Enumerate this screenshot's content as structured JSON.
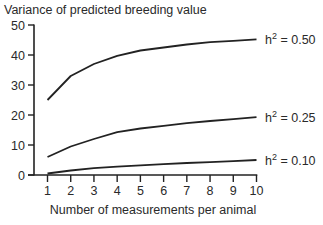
{
  "chart_data": {
    "type": "line",
    "title": "Variance of predicted breeding value",
    "xlabel": "Number of measurements per animal",
    "ylabel": "Variance of predicted breeding value",
    "x": [
      1,
      2,
      3,
      4,
      5,
      6,
      7,
      8,
      9,
      10
    ],
    "xlim": [
      1,
      10
    ],
    "ylim": [
      0,
      50
    ],
    "yticks": [
      0,
      10,
      20,
      30,
      40,
      50
    ],
    "xticks": [
      1,
      2,
      3,
      4,
      5,
      6,
      7,
      8,
      9,
      10
    ],
    "grid": false,
    "legend_position": "inline-right",
    "series": [
      {
        "name": "h2 = 0.50",
        "label_base": "h",
        "label_sup": "2",
        "label_rest": " = 0.50",
        "values": [
          25,
          33,
          37,
          39.7,
          41.5,
          42.5,
          43.5,
          44.3,
          44.7,
          45.2
        ]
      },
      {
        "name": "h2 = 0.25",
        "label_base": "h",
        "label_sup": "2",
        "label_rest": " = 0.25",
        "values": [
          6,
          9.5,
          12,
          14.3,
          15.5,
          16.4,
          17.3,
          18,
          18.6,
          19.3
        ]
      },
      {
        "name": "h2 = 0.10",
        "label_base": "h",
        "label_sup": "2",
        "label_rest": " = 0.10",
        "values": [
          0.5,
          1.5,
          2.3,
          2.8,
          3.2,
          3.6,
          4.0,
          4.3,
          4.6,
          5.0
        ]
      }
    ]
  },
  "colors": {
    "line": "#222222",
    "axis": "#222222",
    "text": "#2a2a2a",
    "background": "#ffffff"
  }
}
